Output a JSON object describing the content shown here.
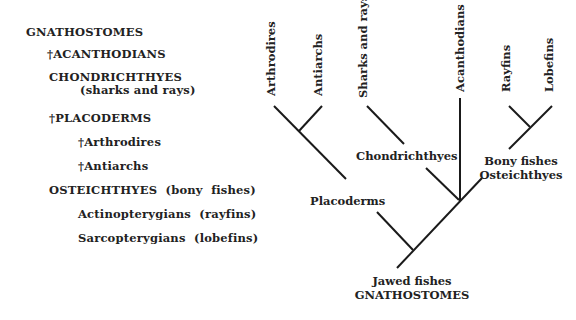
{
  "classification": {
    "items": [
      {
        "label": "GNATHOSTOMES",
        "x": 26,
        "y": 36
      },
      {
        "label": "†ACANTHODIANS",
        "x": 47,
        "y": 58
      },
      {
        "label": "CHONDRICHTHYES",
        "x": 49,
        "y": 81
      },
      {
        "label": "(sharks and rays)",
        "x": 80,
        "y": 94
      },
      {
        "label": "†PLACODERMS",
        "x": 49,
        "y": 122
      },
      {
        "label": "†Arthrodires",
        "x": 78,
        "y": 146
      },
      {
        "label": "†Antiarchs",
        "x": 78,
        "y": 170
      },
      {
        "label": "OSTEICHTHYES  (bony  fishes)",
        "x": 49,
        "y": 194
      },
      {
        "label": "Actinopterygians  (rayfins)",
        "x": 78,
        "y": 218
      },
      {
        "label": "Sarcopterygians  (lobefins)",
        "x": 78,
        "y": 242
      }
    ]
  },
  "tree": {
    "tips": [
      {
        "label": "Arthrodires",
        "x": 275,
        "y": 96
      },
      {
        "label": "Antiarchs",
        "x": 322,
        "y": 96
      },
      {
        "label": "Sharks and rays",
        "x": 367,
        "y": 98
      },
      {
        "label": "Acanthodians",
        "x": 464,
        "y": 92
      },
      {
        "label": "Rayfins",
        "x": 510,
        "y": 92
      },
      {
        "label": "Lobefins",
        "x": 553,
        "y": 92
      }
    ],
    "nodes": [
      {
        "label": "Chondrichthyes",
        "x": 356,
        "y": 160
      },
      {
        "label": "Bony fishes",
        "x": 521,
        "y": 165
      },
      {
        "label": "Osteichthyes",
        "x": 521,
        "y": 179
      },
      {
        "label": "Placoderms",
        "x": 310,
        "y": 205
      },
      {
        "label": "Jawed fishes",
        "x": 412,
        "y": 285
      },
      {
        "label": "GNATHOSTOMES",
        "x": 412,
        "y": 299
      }
    ],
    "line_color": "#1a1a1a"
  }
}
